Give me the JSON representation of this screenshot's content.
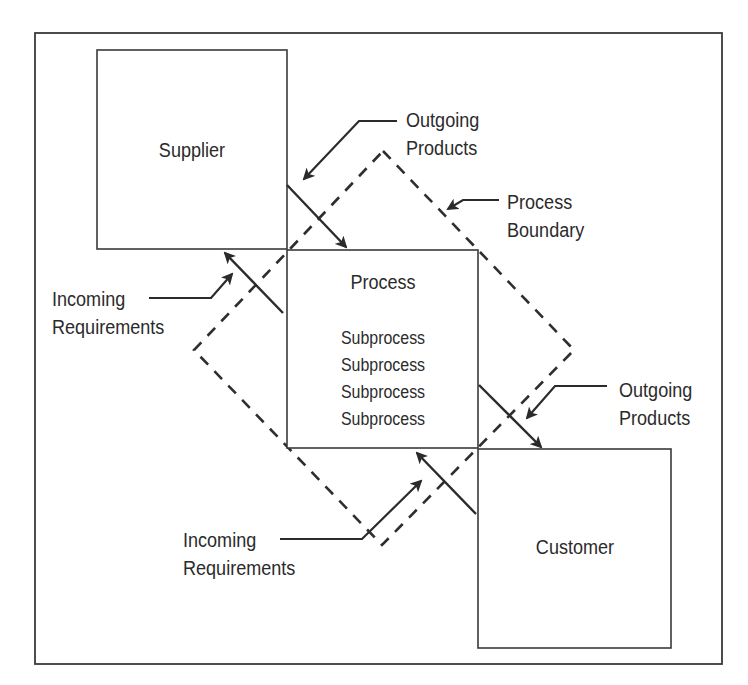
{
  "diagram": {
    "title": "",
    "colors": {
      "stroke": "#2b2b2b",
      "background": "#ffffff"
    },
    "nodes": {
      "supplier": {
        "label": "Supplier"
      },
      "process": {
        "label": "Process",
        "subprocesses": [
          "Subprocess",
          "Subprocess",
          "Subprocess",
          "Subprocess"
        ]
      },
      "customer": {
        "label": "Customer"
      },
      "boundary": {
        "style": "dashed-diamond"
      }
    },
    "callouts": {
      "outgoing_top": {
        "line1": "Outgoing",
        "line2": "Products"
      },
      "process_boundary": {
        "line1": "Process",
        "line2": "Boundary"
      },
      "incoming_left": {
        "line1": "Incoming",
        "line2": "Requirements"
      },
      "outgoing_right": {
        "line1": "Outgoing",
        "line2": "Products"
      },
      "incoming_bottom": {
        "line1": "Incoming",
        "line2": "Requirements"
      }
    },
    "edges": [
      {
        "from": "supplier",
        "to": "process",
        "meaning": "Outgoing Products"
      },
      {
        "from": "process",
        "to": "supplier",
        "meaning": "Incoming Requirements"
      },
      {
        "from": "process",
        "to": "customer",
        "meaning": "Outgoing Products"
      },
      {
        "from": "customer",
        "to": "process",
        "meaning": "Incoming Requirements"
      }
    ]
  }
}
